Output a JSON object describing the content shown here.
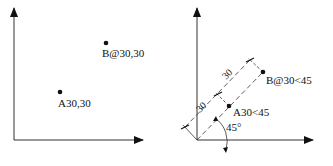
{
  "left_diagram": {
    "description": "Absolute and relative Cartesian coordinates",
    "point_a": {
      "label": "A30,30"
    },
    "point_b": {
      "label": "B@30,30"
    }
  },
  "right_diagram": {
    "description": "Absolute and relative polar coordinates",
    "point_a": {
      "label": "A30<45"
    },
    "point_b": {
      "label": "B@30<45"
    },
    "dimension_1": "30",
    "dimension_2": "30",
    "angle_label": "45°"
  },
  "colors": {
    "ink": "#111111",
    "background": "#ffffff"
  }
}
